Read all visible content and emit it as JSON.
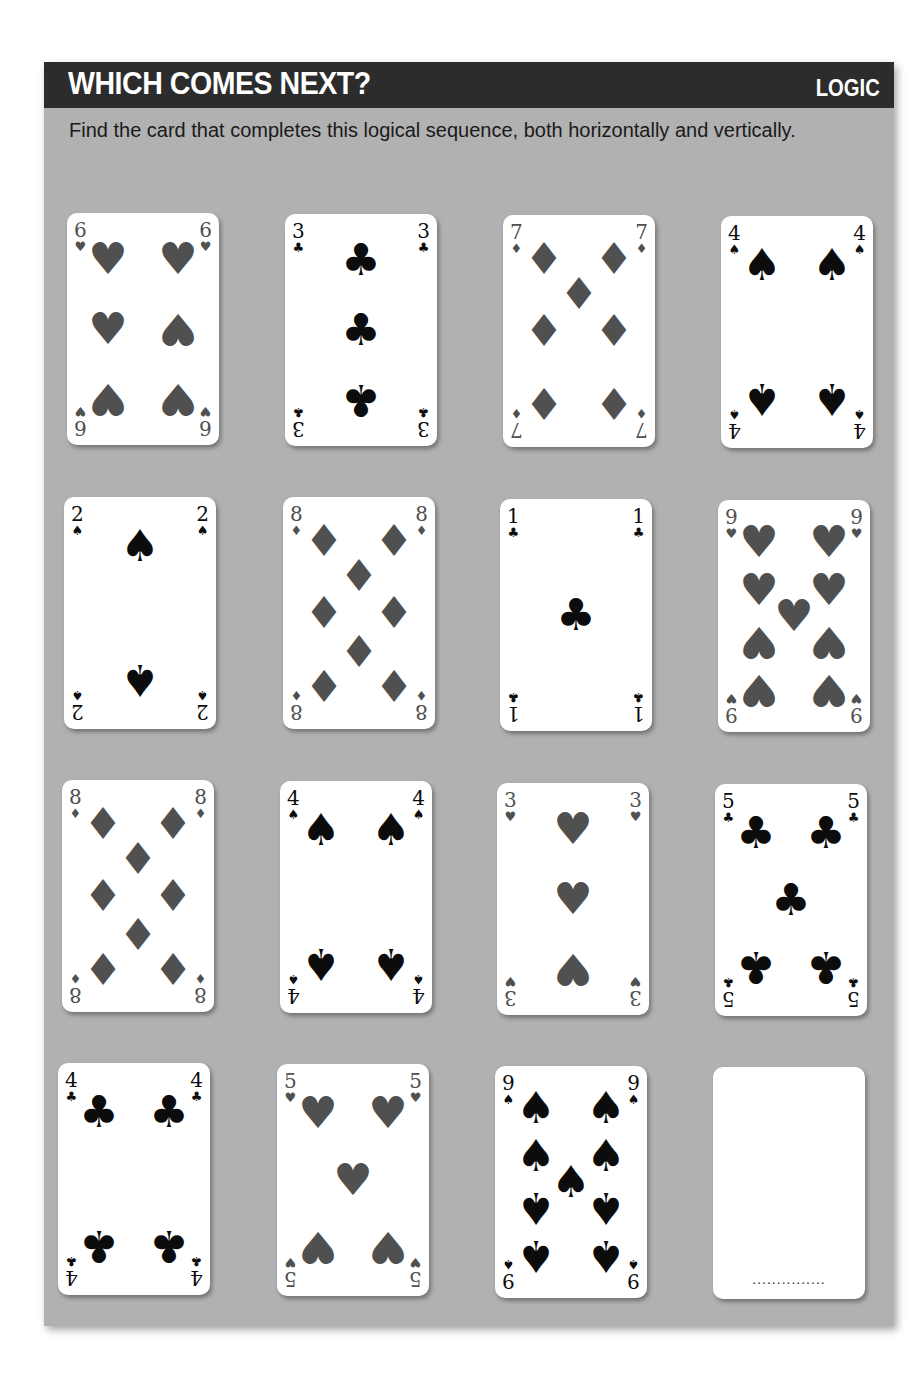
{
  "header": {
    "title": "WHICH COMES NEXT?",
    "category": "LOGIC"
  },
  "instructions": "Find the card that completes this logical sequence, both horizontally and vertically.",
  "colors": {
    "header_bg": "#2c2c2c",
    "panel_bg": "#b1b1b1",
    "red_suit_gray": "#505050",
    "black_suit": "#0c0c0c"
  },
  "suit_glyphs": {
    "hearts": "♥",
    "diamonds": "♦",
    "clubs": "♣",
    "spades": "♠"
  },
  "grid": [
    [
      {
        "rank": "6",
        "suit": "hearts",
        "glyph": "♥",
        "color": "red"
      },
      {
        "rank": "3",
        "suit": "clubs",
        "glyph": "♣",
        "color": "black"
      },
      {
        "rank": "7",
        "suit": "diamonds",
        "glyph": "♦",
        "color": "red"
      },
      {
        "rank": "4",
        "suit": "spades",
        "glyph": "♠",
        "color": "black"
      }
    ],
    [
      {
        "rank": "2",
        "suit": "spades",
        "glyph": "♠",
        "color": "black"
      },
      {
        "rank": "8",
        "suit": "diamonds",
        "glyph": "♦",
        "color": "red"
      },
      {
        "rank": "1",
        "suit": "clubs",
        "glyph": "♣",
        "color": "black"
      },
      {
        "rank": "9",
        "suit": "hearts",
        "glyph": "♥",
        "color": "red"
      }
    ],
    [
      {
        "rank": "8",
        "suit": "diamonds",
        "glyph": "♦",
        "color": "red"
      },
      {
        "rank": "4",
        "suit": "spades",
        "glyph": "♠",
        "color": "black"
      },
      {
        "rank": "3",
        "suit": "hearts",
        "glyph": "♥",
        "color": "red"
      },
      {
        "rank": "5",
        "suit": "clubs",
        "glyph": "♣",
        "color": "black"
      }
    ],
    [
      {
        "rank": "4",
        "suit": "clubs",
        "glyph": "♣",
        "color": "black"
      },
      {
        "rank": "5",
        "suit": "hearts",
        "glyph": "♥",
        "color": "red"
      },
      {
        "rank": "9",
        "suit": "spades",
        "glyph": "♠",
        "color": "black"
      },
      {
        "rank": "",
        "suit": "",
        "glyph": "",
        "color": "",
        "blank": true,
        "answer_placeholder": "..............."
      }
    ]
  ]
}
